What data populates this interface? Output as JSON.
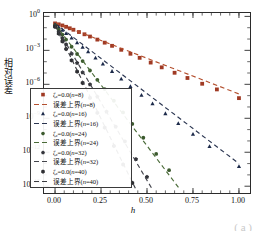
{
  "chart_data": {
    "type": "scatter",
    "title": "",
    "xlabel": "h",
    "ylabel": "相对误差",
    "xlim": [
      -0.06,
      1.06
    ],
    "ylim_log10": [
      -15.6,
      0.3
    ],
    "xticks": [
      "0.00",
      "0.25",
      "0.50",
      "0.75",
      "1.00"
    ],
    "xtick_values": [
      0.0,
      0.25,
      0.5,
      0.75,
      1.0
    ],
    "yticks": [
      "10^0",
      "10^-3",
      "10^-6",
      "10^-9",
      "10^-12",
      "10^-15"
    ],
    "ytick_exponents": [
      0,
      -3,
      -6,
      -9,
      -12,
      -15
    ],
    "grid": false,
    "legend_position": "lower-left-inside",
    "series": [
      {
        "name": "ζ_c=0.0(n=8)",
        "marker": "square",
        "color": "#a03a24",
        "style": "points",
        "x": [
          0.0,
          0.02,
          0.04,
          0.06,
          0.08,
          0.1,
          0.13,
          0.16,
          0.19,
          0.23,
          0.27,
          0.31,
          0.36,
          0.41,
          0.46,
          0.52,
          0.58,
          0.65,
          0.72,
          0.8,
          0.88,
          1.0
        ],
        "y_log10": [
          -0.62,
          -0.7,
          -0.8,
          -0.92,
          -1.05,
          -1.18,
          -1.38,
          -1.58,
          -1.78,
          -2.05,
          -2.32,
          -2.6,
          -2.95,
          -3.3,
          -3.66,
          -4.08,
          -4.5,
          -4.98,
          -5.44,
          -5.95,
          -6.45,
          -7.22
        ]
      },
      {
        "name": "误差上界(n=8)",
        "style": "dashed-line",
        "color": "#b4502f",
        "x": [
          0.0,
          1.0
        ],
        "y_log10": [
          -0.55,
          -6.85
        ]
      },
      {
        "name": "ζ_c=0.0(n=16)",
        "marker": "triangle",
        "color": "#1c2a4a",
        "style": "points",
        "x": [
          0.0,
          0.02,
          0.04,
          0.06,
          0.09,
          0.12,
          0.15,
          0.18,
          0.22,
          0.26,
          0.31,
          0.36,
          0.41,
          0.47,
          0.53,
          0.6,
          0.67,
          0.75,
          0.84,
          1.0
        ],
        "y_log10": [
          -0.72,
          -0.95,
          -1.22,
          -1.5,
          -1.9,
          -2.32,
          -2.72,
          -3.12,
          -3.66,
          -4.2,
          -4.85,
          -5.52,
          -6.18,
          -6.95,
          -7.7,
          -8.58,
          -9.45,
          -10.4,
          -11.48,
          -13.25
        ]
      },
      {
        "name": "误差上界(n=16)",
        "style": "dashed-line",
        "color": "#2a3550",
        "x": [
          0.0,
          1.0
        ],
        "y_log10": [
          -0.62,
          -13.0
        ]
      },
      {
        "name": "ζ_c=0.0(n=24)",
        "marker": "circle",
        "color": "#3c5a2e",
        "style": "points",
        "x": [
          0.0,
          0.02,
          0.04,
          0.06,
          0.09,
          0.12,
          0.15,
          0.19,
          0.23,
          0.27,
          0.32,
          0.37,
          0.42,
          0.48,
          0.55,
          0.62
        ],
        "y_log10": [
          -0.8,
          -1.18,
          -1.62,
          -2.05,
          -2.68,
          -3.32,
          -3.95,
          -4.78,
          -5.6,
          -6.42,
          -7.45,
          -8.48,
          -9.5,
          -10.72,
          -12.15,
          -13.58
        ]
      },
      {
        "name": "误差上界(n=24)",
        "style": "dashed-line",
        "color": "#4a6b38",
        "x": [
          0.0,
          0.68
        ],
        "y_log10": [
          -0.68,
          -15.3
        ]
      },
      {
        "name": "ζ_c=0.0(n=32)",
        "marker": "pentagon",
        "color": "#33343a",
        "style": "points",
        "x": [
          0.0,
          0.02,
          0.04,
          0.06,
          0.09,
          0.12,
          0.15,
          0.19,
          0.23,
          0.28,
          0.33,
          0.38,
          0.44,
          0.5
        ],
        "y_log10": [
          -0.86,
          -1.36,
          -1.92,
          -2.48,
          -3.3,
          -4.12,
          -4.95,
          -6.02,
          -7.1,
          -8.42,
          -9.75,
          -11.05,
          -12.62,
          -14.18
        ]
      },
      {
        "name": "误差上界(n=32)",
        "style": "dashed-line",
        "color": "#44454c",
        "x": [
          0.0,
          0.53
        ],
        "y_log10": [
          -0.74,
          -15.3
        ]
      },
      {
        "name": "ζ_c=0.0(n=40)",
        "marker": "hexagon",
        "color": "#2e2f33",
        "style": "points",
        "x": [
          0.0,
          0.02,
          0.04,
          0.06,
          0.09,
          0.12,
          0.15,
          0.19,
          0.23,
          0.27,
          0.32,
          0.37,
          0.42
        ],
        "y_log10": [
          -0.92,
          -1.52,
          -2.2,
          -2.88,
          -3.88,
          -4.88,
          -5.88,
          -7.2,
          -8.52,
          -9.82,
          -11.45,
          -13.08,
          -14.7
        ]
      },
      {
        "name": "误差上界(n=40)",
        "style": "dashed-line",
        "color": "#3b3c41",
        "x": [
          0.0,
          0.44
        ],
        "y_log10": [
          -0.8,
          -15.3
        ]
      }
    ]
  },
  "legend": {
    "entries": [
      {
        "label_pre": "ζ",
        "label_sub": "c",
        "label_post": "=0.0(",
        "italic_n": "n",
        "label_end": "=8)",
        "kind": "marker",
        "marker": "square",
        "color": "#a03a24"
      },
      {
        "label_pre": "误差上界(",
        "label_sub": "",
        "label_post": "",
        "italic_n": "n",
        "label_end": "=8)",
        "kind": "line",
        "color": "#b4502f"
      },
      {
        "label_pre": "ζ",
        "label_sub": "c",
        "label_post": "=0.0(",
        "italic_n": "n",
        "label_end": "=16)",
        "kind": "marker",
        "marker": "triangle",
        "color": "#1c2a4a"
      },
      {
        "label_pre": "误差上界(",
        "label_sub": "",
        "label_post": "",
        "italic_n": "n",
        "label_end": "=16)",
        "kind": "line",
        "color": "#2a3550"
      },
      {
        "label_pre": "ζ",
        "label_sub": "c",
        "label_post": "=0.0(",
        "italic_n": "n",
        "label_end": "=24)",
        "kind": "marker",
        "marker": "circle",
        "color": "#3c5a2e"
      },
      {
        "label_pre": "误差上界(",
        "label_sub": "",
        "label_post": "",
        "italic_n": "n",
        "label_end": "=24)",
        "kind": "line",
        "color": "#4a6b38"
      },
      {
        "label_pre": "ζ",
        "label_sub": "c",
        "label_post": "=0.0(",
        "italic_n": "n",
        "label_end": "=32)",
        "kind": "marker",
        "marker": "pentagon",
        "color": "#33343a"
      },
      {
        "label_pre": "误差上界(",
        "label_sub": "",
        "label_post": "",
        "italic_n": "n",
        "label_end": "=32)",
        "kind": "line",
        "color": "#44454c"
      },
      {
        "label_pre": "ζ",
        "label_sub": "c",
        "label_post": "=0.0(",
        "italic_n": "n",
        "label_end": "=40)",
        "kind": "marker",
        "marker": "hexagon",
        "color": "#2e2f33"
      },
      {
        "label_pre": "误差上界(",
        "label_sub": "",
        "label_post": "",
        "italic_n": "n",
        "label_end": "=40)",
        "kind": "line",
        "color": "#3b3c41"
      }
    ]
  },
  "caption": "( a )"
}
